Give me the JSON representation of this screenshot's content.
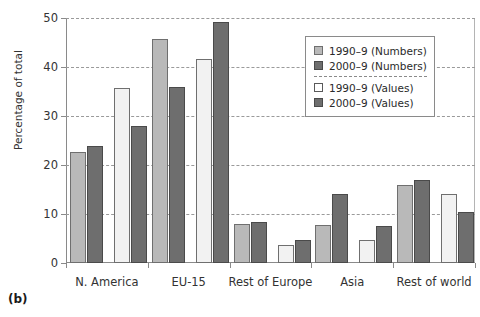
{
  "panel": {
    "label": "(b)"
  },
  "chart_data": {
    "type": "bar",
    "title": "",
    "xlabel": "",
    "ylabel": "Percentage of total",
    "categories": [
      "N. America",
      "EU-15",
      "Rest of Europe",
      "Asia",
      "Rest of world"
    ],
    "series": [
      {
        "name": "1990–9 (Numbers)",
        "color": "#b9b9b9",
        "values": [
          22.7,
          45.8,
          8.0,
          7.8,
          16.0
        ]
      },
      {
        "name": "2000–9 (Numbers)",
        "color": "#6e6e6e",
        "values": [
          23.9,
          36.0,
          8.3,
          14.0,
          17.0
        ]
      },
      {
        "name": "1990–9 (Values)",
        "color": "#f2f2f2",
        "values": [
          35.8,
          41.7,
          3.6,
          4.6,
          14.0
        ]
      },
      {
        "name": "2000–9 (Values)",
        "color": "#6e6e6e",
        "values": [
          28.0,
          49.2,
          4.7,
          7.6,
          10.4
        ]
      }
    ],
    "ylim": [
      0,
      50
    ],
    "yticks": [
      0,
      10,
      20,
      30,
      40,
      50
    ],
    "grid": true,
    "legend_position": "top-right"
  }
}
